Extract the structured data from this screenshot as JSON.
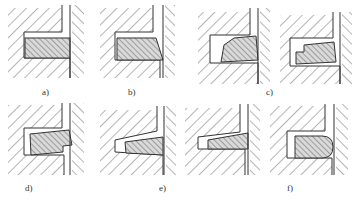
{
  "figure": {
    "colors": {
      "line": "#333333",
      "ring_fill": "#d9d9d9",
      "hatch": "#555555",
      "background": "#ffffff"
    },
    "panels": [
      {
        "id": "a",
        "label": "a)",
        "ring_shape": "rectangular"
      },
      {
        "id": "b",
        "label": "b)",
        "ring_shape": "taper-faced"
      },
      {
        "id": "c",
        "label": "c)",
        "ring_shape": "bevel / stepped (two variants)"
      },
      {
        "id": "d",
        "label": "d)",
        "ring_shape": "keystone with step"
      },
      {
        "id": "e",
        "label": "e)",
        "ring_shape": "half-keystone (two variants)"
      },
      {
        "id": "f",
        "label": "f)",
        "ring_shape": "barrel-faced"
      }
    ]
  }
}
